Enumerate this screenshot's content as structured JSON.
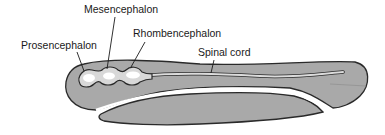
{
  "diagram": {
    "type": "anatomical-illustration",
    "labels": {
      "mesencephalon": "Mesencephalon",
      "prosencephalon": "Prosencephalon",
      "rhombencephalon": "Rhombencephalon",
      "spinal_cord": "Spinal cord"
    },
    "colors": {
      "body_fill": "#a9a9a9",
      "body_stroke": "#2a2a2a",
      "tube_fill": "#e6e6e6",
      "tube_highlight": "#ffffff",
      "leader_line": "#1a1a1a",
      "text": "#1a1a1a"
    }
  }
}
